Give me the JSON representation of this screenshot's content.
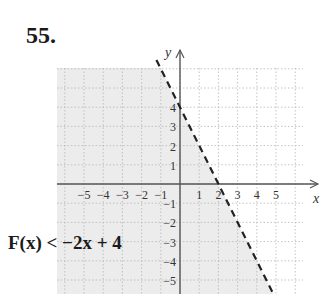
{
  "problem": {
    "number": "55."
  },
  "chart_data": {
    "type": "line",
    "title": "",
    "xlabel": "x",
    "ylabel": "y",
    "xlim": [
      -6.4,
      6.5
    ],
    "ylim": [
      -5.6,
      6.2
    ],
    "grid": true,
    "grid_style": "dotted",
    "x_ticks": [
      -5,
      -4,
      -3,
      -2,
      -1,
      1,
      2,
      3,
      4,
      5
    ],
    "y_ticks": [
      -5,
      -4,
      -3,
      -2,
      -1,
      1,
      2,
      3,
      4
    ],
    "x_tick_labels": [
      "−5",
      "−4",
      "−3",
      "−2",
      "−1",
      "1",
      "2",
      "3",
      "4",
      "5"
    ],
    "y_tick_labels": [
      "−5",
      "−4",
      "−3",
      "−2",
      "−1",
      "1",
      "2",
      "3",
      "4"
    ],
    "series": [
      {
        "name": "boundary y = −2x + 4",
        "style": "dashed",
        "color": "#222222",
        "equation": "y = -2x + 4",
        "slope": -2,
        "intercept": 4,
        "points": [
          [
            -1,
            6
          ],
          [
            0,
            4
          ],
          [
            2,
            0
          ],
          [
            4.8,
            -5.6
          ]
        ]
      }
    ],
    "shaded_region": {
      "description": "below the line (left side)",
      "inequality": "y < -2x + 4",
      "color": "#ececec"
    },
    "annotation": "F(x) < −2x + 4",
    "labels": {
      "x_axis": "x",
      "y_axis": "y"
    }
  },
  "colors": {
    "shade": "#ececec",
    "grid": "#b5b5b5",
    "axis": "#555555",
    "line": "#222222",
    "text": "#333333"
  },
  "annotation_text": "F(x) < −2x + 4"
}
